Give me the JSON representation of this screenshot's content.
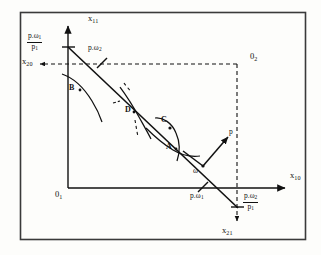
{
  "figure": {
    "type": "economics-budget-line-diagram",
    "title": "",
    "background_color": "#fdfdfb",
    "ink_color": "#111111",
    "border": {
      "present": true,
      "x": 20,
      "y": 12,
      "width": 286,
      "height": 228,
      "color": "#3a3a3a"
    }
  },
  "axes": {
    "vertical": {
      "label": "x",
      "sub": "11",
      "label_x": 91,
      "label_y": 17,
      "line_x": 68,
      "line_top": 26,
      "line_bottom": 188
    },
    "horizontal": {
      "label": "x",
      "sub": "10",
      "label_x": 292,
      "label_y": 175,
      "line_y": 188,
      "line_left": 68,
      "line_right": 285
    },
    "origin_1": {
      "label": "0",
      "sub": "1",
      "x": 57,
      "y": 190
    },
    "origin_2": {
      "label": "0",
      "sub": "2",
      "x": 253,
      "y": 57
    },
    "second_vertical": {
      "label": "x",
      "sub": "21",
      "label_x": 222,
      "label_y": 228,
      "dashed_x": 237,
      "dashed_top": 64,
      "dashed_bottom": 218
    },
    "second_horizontal": {
      "label": "x",
      "sub": "20",
      "label_x": 25,
      "label_y": 56,
      "dashed_y": 64,
      "dashed_left": 37,
      "dashed_right": 237
    }
  },
  "budget_line": {
    "from_x": 68,
    "from_y": 47,
    "to_x": 237,
    "to_y": 207,
    "slope_note": "downward sloping budget line through endowment"
  },
  "endowment": {
    "label": "ω",
    "x": 196,
    "y": 171,
    "point_x": 203,
    "point_y": 166
  },
  "price_vector": {
    "label": "p",
    "label_x": 230,
    "label_y": 130,
    "tail_x": 203,
    "tail_y": 166,
    "head_x": 228,
    "head_y": 137
  },
  "intercepts": {
    "vertical_top": {
      "numerator": "p.ω",
      "numerator_sub": "1",
      "denominator": "p",
      "denominator_sub": "1",
      "x": 34,
      "y": 36
    },
    "horizontal_bottom": {
      "numerator": "p.ω",
      "numerator_sub": "2",
      "denominator": "p",
      "denominator_sub": "1",
      "x": 243,
      "y": 196
    },
    "upper_mark": {
      "label": "p.ω",
      "sub": "2",
      "x": 92,
      "y": 47,
      "tick_x": 102,
      "tick_y": 61
    },
    "lower_mark": {
      "label": "p.ω",
      "sub": "1",
      "x": 193,
      "y": 190,
      "tick_x": 203,
      "tick_y": 186
    }
  },
  "points": [
    {
      "id": "A",
      "label": "A",
      "label_x": 167,
      "label_y": 145,
      "dot_x": 176,
      "dot_y": 148
    },
    {
      "id": "B",
      "label": "B",
      "label_x": 70,
      "label_y": 86,
      "dot_x": 79,
      "dot_y": 90
    },
    {
      "id": "C",
      "label": "C",
      "label_x": 162,
      "label_y": 118,
      "dot_x": 167,
      "dot_y": 127
    },
    {
      "id": "D",
      "label": "D",
      "label_x": 126,
      "label_y": 108,
      "dot_x": 134,
      "dot_y": 112
    }
  ],
  "indifference_curves": [
    {
      "near_point": "B",
      "description": "curve tangent near B"
    },
    {
      "near_point": "D",
      "description": "steep curve crossing at D"
    },
    {
      "near_point": "C",
      "description": "small closed-ish curve around C"
    },
    {
      "near_point": "A",
      "description": "curve tangent near A"
    }
  ],
  "dash_pattern": "4 3",
  "stroke_widths": {
    "axis": 1.4,
    "budget": 1.5,
    "curve": 1.2,
    "dashed": 1.1
  }
}
